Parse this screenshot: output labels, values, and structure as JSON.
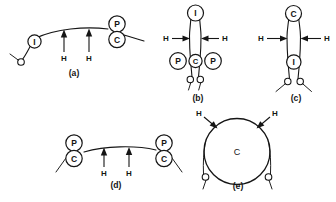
{
  "figure": {
    "background_color": "#ffffff",
    "ink_color": "#151515",
    "width": 336,
    "height": 202
  },
  "panels": [
    {
      "id": "a",
      "caption": "(a)",
      "nodes": [
        {
          "label": "I",
          "role": "interstitial-node"
        },
        {
          "label": "P",
          "role": "proximal-node"
        },
        {
          "label": "C",
          "role": "centromere-node"
        }
      ],
      "force_labels": [
        "H",
        "H"
      ],
      "force_direction": "up"
    },
    {
      "id": "b",
      "caption": "(b)",
      "nodes": [
        {
          "label": "I",
          "role": "interstitial-node"
        },
        {
          "label": "P",
          "role": "proximal-node-left"
        },
        {
          "label": "C",
          "role": "centromere-node"
        },
        {
          "label": "P",
          "role": "proximal-node-right"
        }
      ],
      "force_labels": [
        "H",
        "H"
      ],
      "force_direction": "inward-horizontal"
    },
    {
      "id": "c",
      "caption": "(c)",
      "nodes": [
        {
          "label": "C",
          "role": "centromere-node"
        },
        {
          "label": "I",
          "role": "interstitial-node"
        }
      ],
      "force_labels": [
        "H",
        "H"
      ],
      "force_direction": "inward-horizontal"
    },
    {
      "id": "d",
      "caption": "(d)",
      "nodes": [
        {
          "label": "P",
          "role": "proximal-node-left"
        },
        {
          "label": "C",
          "role": "centromere-node-left"
        },
        {
          "label": "P",
          "role": "proximal-node-right"
        },
        {
          "label": "C",
          "role": "centromere-node-right"
        }
      ],
      "force_labels": [
        "H",
        "H"
      ],
      "force_direction": "up"
    },
    {
      "id": "e",
      "caption": "(e)",
      "nodes": [
        {
          "label": "C",
          "role": "centromere-ring"
        }
      ],
      "force_labels": [
        "H",
        "H"
      ],
      "force_direction": "inward-diagonal"
    }
  ],
  "labels": {
    "a": {
      "caption": "(a)",
      "node_I": "I",
      "node_P": "P",
      "node_C": "C",
      "h_left": "H",
      "h_right": "H"
    },
    "b": {
      "caption": "(b)",
      "node_I": "I",
      "node_P_left": "P",
      "node_C": "C",
      "node_P_right": "P",
      "h_left": "H",
      "h_right": "H"
    },
    "c": {
      "caption": "(c)",
      "node_C": "C",
      "node_I": "I",
      "h_left": "H",
      "h_right": "H"
    },
    "d": {
      "caption": "(d)",
      "node_P_left": "P",
      "node_C_left": "C",
      "node_P_right": "P",
      "node_C_right": "C",
      "h_left": "H",
      "h_right": "H"
    },
    "e": {
      "caption": "(e)",
      "node_C": "C",
      "h_left": "H",
      "h_right": "H"
    }
  }
}
